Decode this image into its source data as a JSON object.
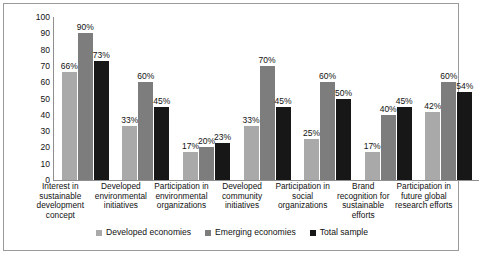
{
  "chart_data": {
    "type": "bar",
    "title": "",
    "xlabel": "",
    "ylabel": "",
    "ylim": [
      0,
      100
    ],
    "ytick_values": [
      100,
      90,
      80,
      70,
      60,
      50,
      40,
      30,
      20,
      10,
      0
    ],
    "grid": false,
    "legend_position": "bottom",
    "categories": [
      "Interest in sustainable development concept",
      "Developed environmental initiatives",
      "Participation in environmental organizations",
      "Developed community initiatives",
      "Participation in social organizations",
      "Brand recognition for sustainable efforts",
      "Participation in future global research efforts"
    ],
    "series": [
      {
        "name": "Developed economies",
        "color": "#a9a9a9",
        "values": [
          66,
          33,
          17,
          33,
          25,
          17,
          42
        ],
        "labels": [
          "66%",
          "33%",
          "17%",
          "33%",
          "25%",
          "17%",
          "42%"
        ]
      },
      {
        "name": "Emerging economies",
        "color": "#7d7d7d",
        "values": [
          90,
          60,
          20,
          70,
          60,
          40,
          60
        ],
        "labels": [
          "90%",
          "60%",
          "20%",
          "70%",
          "60%",
          "40%",
          "60%"
        ]
      },
      {
        "name": "Total sample",
        "color": "#171717",
        "values": [
          73,
          45,
          23,
          45,
          50,
          45,
          54
        ],
        "labels": [
          "73%",
          "45%",
          "23%",
          "45%",
          "50%",
          "45%",
          "54%"
        ]
      }
    ]
  }
}
